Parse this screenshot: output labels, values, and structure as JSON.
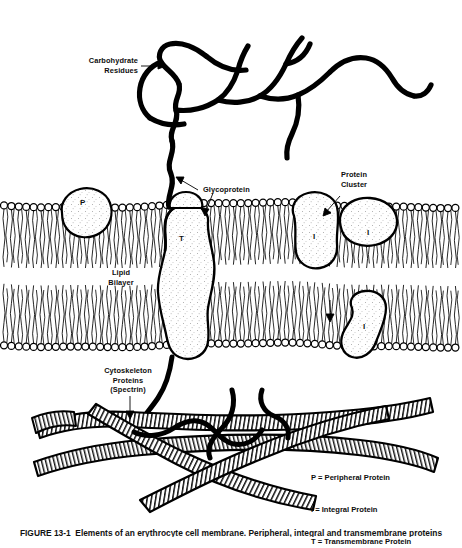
{
  "figure": {
    "caption": "FIGURE 13-1  Elements of an erythrocyte cell membrane. Peripheral, integral and transmembrane proteins"
  },
  "labels": {
    "carbohydrate_residues": "Carbohydrate\nResidues",
    "glycoprotein": "Glycoprotein",
    "protein_cluster": "Protein\nCluster",
    "lipid_bilayer": "Lipid\nBilayer",
    "cytoskeleton_proteins": "Cytoskeleton\nProteins\n(Spectrin)"
  },
  "protein_marks": {
    "peripheral": "P",
    "transmembrane": "T",
    "integral_1": "I",
    "integral_2": "I",
    "integral_3": "I"
  },
  "legend": {
    "items": [
      "P = Peripheral Protein",
      "I = Integral Protein",
      "T = Transmembrane Protein"
    ]
  },
  "colors": {
    "ink": "#000000",
    "background": "#ffffff",
    "protein_fill": "#fdfdfd",
    "stipple": "#8a8a8a"
  }
}
